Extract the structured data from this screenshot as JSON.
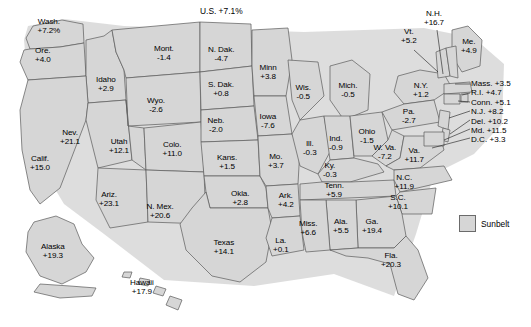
{
  "title": "U.S. +7.1%",
  "legend": {
    "label": "Sunbelt",
    "swatch_color": "#d6d6d6"
  },
  "chart_data": {
    "type": "map",
    "title": "U.S. +7.1%",
    "national_value": "+7.1%",
    "units": "percent change",
    "legend": [
      "Sunbelt"
    ],
    "regions": [
      {
        "name": "Wash.",
        "value": "+7.2%",
        "num": 7.2,
        "x": 49,
        "y": 26
      },
      {
        "name": "Ore.",
        "value": "+4.0",
        "num": 4.0,
        "x": 43,
        "y": 55
      },
      {
        "name": "Idaho",
        "value": "+2.9",
        "num": 2.9,
        "x": 106,
        "y": 84
      },
      {
        "name": "Mont.",
        "value": "-1.4",
        "num": -1.4,
        "x": 164,
        "y": 53
      },
      {
        "name": "N. Dak.",
        "value": "-4.7",
        "num": -4.7,
        "x": 221,
        "y": 54
      },
      {
        "name": "S. Dak.",
        "value": "+0.8",
        "num": 0.8,
        "x": 221,
        "y": 89
      },
      {
        "name": "Minn",
        "value": "+3.8",
        "num": 3.8,
        "x": 268,
        "y": 72
      },
      {
        "name": "Wis.",
        "value": "-0.5",
        "num": -0.5,
        "x": 303,
        "y": 92
      },
      {
        "name": "Mich.",
        "value": "-0.5",
        "num": -0.5,
        "x": 348,
        "y": 90
      },
      {
        "name": "Wyo.",
        "value": "-2.6",
        "num": -2.6,
        "x": 156,
        "y": 105
      },
      {
        "name": "Neb.",
        "value": "-2.0",
        "num": -2.0,
        "x": 216,
        "y": 125
      },
      {
        "name": "Iowa",
        "value": "-7.6",
        "num": -7.6,
        "x": 268,
        "y": 121
      },
      {
        "name": "Nev.",
        "value": "+21.1",
        "num": 21.1,
        "x": 70,
        "y": 137
      },
      {
        "name": "Utah",
        "value": "+12.1",
        "num": 12.1,
        "x": 119,
        "y": 146
      },
      {
        "name": "Colo.",
        "value": "+11.0",
        "num": 11.0,
        "x": 172,
        "y": 149
      },
      {
        "name": "Kans.",
        "value": "+1.5",
        "num": 1.5,
        "x": 227,
        "y": 162
      },
      {
        "name": "Mo.",
        "value": "+3.7",
        "num": 3.7,
        "x": 276,
        "y": 161
      },
      {
        "name": "Ill.",
        "value": "-0.3",
        "num": -0.3,
        "x": 310,
        "y": 148
      },
      {
        "name": "Ind.",
        "value": "-0.9",
        "num": -0.9,
        "x": 336,
        "y": 143
      },
      {
        "name": "Ohio",
        "value": "-1.5",
        "num": -1.5,
        "x": 367,
        "y": 136
      },
      {
        "name": "Ky.",
        "value": "-0.3",
        "num": -0.3,
        "x": 330,
        "y": 170
      },
      {
        "name": "W. Va.",
        "value": "-7.2",
        "num": -7.2,
        "x": 385,
        "y": 152
      },
      {
        "name": "Va.",
        "value": "+11.7",
        "num": 11.7,
        "x": 414,
        "y": 155
      },
      {
        "name": "Calif.",
        "value": "+15.0",
        "num": 15.0,
        "x": 40,
        "y": 163
      },
      {
        "name": "Ariz.",
        "value": "+23.1",
        "num": 23.1,
        "x": 109,
        "y": 199
      },
      {
        "name": "N. Mex.",
        "value": "+20.6",
        "num": 20.6,
        "x": 160,
        "y": 211
      },
      {
        "name": "Okla.",
        "value": "+2.8",
        "num": 2.8,
        "x": 240,
        "y": 198
      },
      {
        "name": "Ark.",
        "value": "+4.2",
        "num": 4.2,
        "x": 286,
        "y": 200
      },
      {
        "name": "Tenn.",
        "value": "+5.9",
        "num": 5.9,
        "x": 334,
        "y": 190
      },
      {
        "name": "N.C.",
        "value": "+11.9",
        "num": 11.9,
        "x": 404,
        "y": 182
      },
      {
        "name": "S.C.",
        "value": "+10.1",
        "num": 10.1,
        "x": 398,
        "y": 202
      },
      {
        "name": "Miss.",
        "value": "+6.6",
        "num": 6.6,
        "x": 308,
        "y": 228
      },
      {
        "name": "Ala.",
        "value": "+5.5",
        "num": 5.5,
        "x": 341,
        "y": 226
      },
      {
        "name": "Ga.",
        "value": "+19.4",
        "num": 19.4,
        "x": 372,
        "y": 226
      },
      {
        "name": "La.",
        "value": "+0.1",
        "num": 0.1,
        "x": 281,
        "y": 245
      },
      {
        "name": "Texas",
        "value": "+14.1",
        "num": 14.1,
        "x": 224,
        "y": 247
      },
      {
        "name": "Fla.",
        "value": "+20.3",
        "num": 20.3,
        "x": 391,
        "y": 260
      },
      {
        "name": "Alaska",
        "value": "+19.3",
        "num": 19.3,
        "x": 53,
        "y": 251
      },
      {
        "name": "Hawaii",
        "value": "+17.9",
        "num": 17.9,
        "x": 142,
        "y": 287
      },
      {
        "name": "N.H.",
        "value": "+16.7",
        "num": 16.7,
        "x": 434,
        "y": 18
      },
      {
        "name": "Vt.",
        "value": "+5.2",
        "num": 5.2,
        "x": 409,
        "y": 36
      },
      {
        "name": "Me.",
        "value": "+4.9",
        "num": 4.9,
        "x": 469,
        "y": 46
      },
      {
        "name": "N.Y.",
        "value": "+1.2",
        "num": 1.2,
        "x": 421,
        "y": 90
      },
      {
        "name": "Pa.",
        "value": "-2.7",
        "num": -2.7,
        "x": 409,
        "y": 116
      }
    ],
    "callouts": [
      {
        "name": "Mass.",
        "value": "+3.5",
        "num": 3.5,
        "label": "Mass. +3.5"
      },
      {
        "name": "R.I.",
        "value": "+4.7",
        "num": 4.7,
        "label": "R.I. +4.7"
      },
      {
        "name": "Conn.",
        "value": "+5.1",
        "num": 5.1,
        "label": "Conn. +5.1"
      },
      {
        "name": "N.J.",
        "value": "+8.2",
        "num": 8.2,
        "label": "N.J. +8.2"
      },
      {
        "name": "Del.",
        "value": "+10.2",
        "num": 10.2,
        "label": "Del. +10.2"
      },
      {
        "name": "Md.",
        "value": "+11.5",
        "num": 11.5,
        "label": "Md. +11.5"
      },
      {
        "name": "D.C.",
        "value": "+3.3",
        "num": 3.3,
        "label": "D.C. +3.3"
      }
    ]
  }
}
